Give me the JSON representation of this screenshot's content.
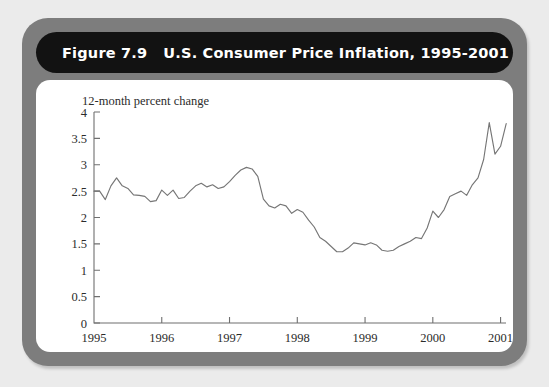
{
  "figure": {
    "label": "Figure 7.9",
    "title": "U.S. Consumer Price Inflation, 1995-2001",
    "title_bar_color": "#121212",
    "frame_color": "#7d7d7d",
    "panel_color": "#ffffff",
    "page_background": "#ebebeb"
  },
  "chart_data": {
    "type": "line",
    "title": "U.S. Consumer Price Inflation, 1995-2001",
    "subtitle": "",
    "xlabel": "",
    "ylabel": "12-month percent change",
    "ylim": [
      0,
      4
    ],
    "xlim": [
      1995,
      2001.08
    ],
    "yticks": [
      0,
      0.5,
      1,
      1.5,
      2,
      2.5,
      3,
      3.5,
      4
    ],
    "ytick_labels": [
      "0",
      "0.5",
      "1",
      "1.5",
      "2",
      "2.5",
      "3",
      "3.5",
      "4"
    ],
    "xticks": [
      1995,
      1996,
      1997,
      1998,
      1999,
      2000,
      2001
    ],
    "xtick_labels": [
      "1995",
      "1996",
      "1997",
      "1998",
      "1999",
      "2000",
      "2001"
    ],
    "grid": false,
    "legend": null,
    "line_color": "#767676",
    "series": [
      {
        "name": "12-month percent change",
        "x": [
          1995.0,
          1995.083,
          1995.167,
          1995.25,
          1995.333,
          1995.417,
          1995.5,
          1995.583,
          1995.667,
          1995.75,
          1995.833,
          1995.917,
          1996.0,
          1996.083,
          1996.167,
          1996.25,
          1996.333,
          1996.417,
          1996.5,
          1996.583,
          1996.667,
          1996.75,
          1996.833,
          1996.917,
          1997.0,
          1997.083,
          1997.167,
          1997.25,
          1997.333,
          1997.417,
          1997.5,
          1997.583,
          1997.667,
          1997.75,
          1997.833,
          1997.917,
          1998.0,
          1998.083,
          1998.167,
          1998.25,
          1998.333,
          1998.417,
          1998.5,
          1998.583,
          1998.667,
          1998.75,
          1998.833,
          1998.917,
          1999.0,
          1999.083,
          1999.167,
          1999.25,
          1999.333,
          1999.417,
          1999.5,
          1999.583,
          1999.667,
          1999.75,
          1999.833,
          1999.917,
          2000.0,
          2000.083,
          2000.167,
          2000.25,
          2000.333,
          2000.417,
          2000.5,
          2000.583,
          2000.667,
          2000.75,
          2000.833,
          2000.917,
          2001.0,
          2001.083
        ],
        "values": [
          2.5,
          2.5,
          2.34,
          2.6,
          2.75,
          2.6,
          2.55,
          2.43,
          2.42,
          2.4,
          2.3,
          2.32,
          2.52,
          2.42,
          2.52,
          2.36,
          2.38,
          2.5,
          2.6,
          2.65,
          2.58,
          2.62,
          2.55,
          2.58,
          2.68,
          2.8,
          2.9,
          2.95,
          2.92,
          2.78,
          2.35,
          2.22,
          2.18,
          2.25,
          2.22,
          2.08,
          2.15,
          2.1,
          1.95,
          1.82,
          1.62,
          1.55,
          1.45,
          1.35,
          1.35,
          1.42,
          1.52,
          1.5,
          1.48,
          1.52,
          1.48,
          1.38,
          1.36,
          1.38,
          1.45,
          1.5,
          1.55,
          1.62,
          1.6,
          1.8,
          2.12,
          2.0,
          2.15,
          2.4,
          2.45,
          2.5,
          2.42,
          2.62,
          2.75,
          3.1,
          3.8,
          3.2,
          3.35,
          3.78
        ]
      }
    ],
    "annotations": [
      {
        "text": "peak",
        "x": 2000.833,
        "y": 3.8
      },
      {
        "text": "trough",
        "x": 1998.583,
        "y": 1.35
      }
    ]
  }
}
